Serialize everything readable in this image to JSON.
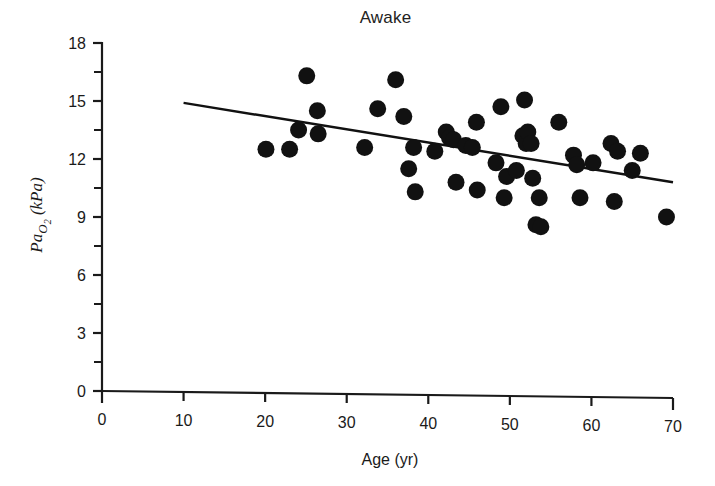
{
  "chart_data": {
    "type": "scatter",
    "title": "Awake",
    "xlabel": "Age (yr)",
    "ylabel_parts": {
      "main": "Pa",
      "subscript": "O",
      "subsubscript": "2",
      "units": " (kPa)"
    },
    "ylabel": "PaO2 (kPa)",
    "xlim": [
      0,
      70
    ],
    "ylim": [
      0,
      18
    ],
    "xticks": [
      0,
      10,
      20,
      30,
      40,
      50,
      60,
      70
    ],
    "xtick_labels": [
      "0",
      "10",
      "20",
      "30",
      "40",
      "50",
      "60",
      "70"
    ],
    "yticks": [
      0,
      3,
      6,
      9,
      12,
      15,
      18
    ],
    "ytick_labels": [
      "0",
      "3",
      "6",
      "9",
      "12",
      "15",
      "18"
    ],
    "y_minor_ticks": [
      1.5,
      4.5,
      7.5,
      10.5,
      13.5,
      16.5
    ],
    "grid": false,
    "legend": null,
    "marker": {
      "shape": "circle",
      "color": "#111111",
      "radius_px": 8.5
    },
    "trend_line": {
      "label": "regression line",
      "x_start": 10,
      "y_start": 14.9,
      "x_end": 70,
      "y_end": 10.8,
      "color": "#111111",
      "width_px": 2.4
    },
    "points": [
      {
        "age": 20.1,
        "pao2": 12.5
      },
      {
        "age": 23.0,
        "pao2": 12.5
      },
      {
        "age": 24.1,
        "pao2": 13.5
      },
      {
        "age": 25.1,
        "pao2": 16.3
      },
      {
        "age": 26.4,
        "pao2": 14.5
      },
      {
        "age": 26.5,
        "pao2": 13.3
      },
      {
        "age": 32.2,
        "pao2": 12.6
      },
      {
        "age": 33.8,
        "pao2": 14.6
      },
      {
        "age": 36.0,
        "pao2": 16.1
      },
      {
        "age": 37.0,
        "pao2": 14.2
      },
      {
        "age": 37.6,
        "pao2": 11.5
      },
      {
        "age": 38.2,
        "pao2": 12.6
      },
      {
        "age": 38.4,
        "pao2": 10.3
      },
      {
        "age": 40.8,
        "pao2": 12.4
      },
      {
        "age": 42.2,
        "pao2": 13.4
      },
      {
        "age": 42.6,
        "pao2": 13.1
      },
      {
        "age": 43.1,
        "pao2": 13.0
      },
      {
        "age": 43.4,
        "pao2": 10.8
      },
      {
        "age": 44.6,
        "pao2": 12.7
      },
      {
        "age": 45.4,
        "pao2": 12.6
      },
      {
        "age": 45.9,
        "pao2": 13.9
      },
      {
        "age": 46.0,
        "pao2": 10.4
      },
      {
        "age": 48.3,
        "pao2": 11.8
      },
      {
        "age": 48.9,
        "pao2": 14.7
      },
      {
        "age": 49.3,
        "pao2": 10.0
      },
      {
        "age": 49.6,
        "pao2": 11.1
      },
      {
        "age": 50.8,
        "pao2": 11.4
      },
      {
        "age": 51.6,
        "pao2": 13.2
      },
      {
        "age": 51.8,
        "pao2": 15.05
      },
      {
        "age": 52.0,
        "pao2": 12.8
      },
      {
        "age": 52.2,
        "pao2": 13.4
      },
      {
        "age": 52.6,
        "pao2": 12.8
      },
      {
        "age": 52.8,
        "pao2": 11.0
      },
      {
        "age": 53.2,
        "pao2": 8.6
      },
      {
        "age": 53.6,
        "pao2": 10.0
      },
      {
        "age": 53.8,
        "pao2": 8.5
      },
      {
        "age": 56.0,
        "pao2": 13.9
      },
      {
        "age": 57.8,
        "pao2": 12.2
      },
      {
        "age": 58.2,
        "pao2": 11.7
      },
      {
        "age": 58.6,
        "pao2": 10.0
      },
      {
        "age": 60.2,
        "pao2": 11.8
      },
      {
        "age": 62.4,
        "pao2": 12.8
      },
      {
        "age": 62.8,
        "pao2": 9.8
      },
      {
        "age": 63.2,
        "pao2": 12.4
      },
      {
        "age": 65.0,
        "pao2": 11.4
      },
      {
        "age": 66.0,
        "pao2": 12.3
      },
      {
        "age": 69.2,
        "pao2": 9.0
      }
    ]
  }
}
